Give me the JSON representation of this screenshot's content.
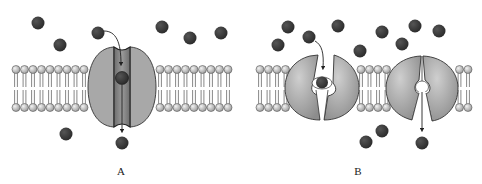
{
  "diagram": {
    "panels": [
      {
        "id": "A",
        "label": "A",
        "type": "channel-protein",
        "description": "Solute passes through an open aqueous channel across the lipid bilayer"
      },
      {
        "id": "B",
        "label": "B",
        "type": "carrier-protein",
        "description": "Solute binds carrier, carrier changes conformation, solute released on the other side"
      }
    ],
    "colors": {
      "molecule": "#3a3a3a",
      "protein": "#a9a9a9",
      "protein_dark": "#7a7a7a",
      "lipid_head": "#bdbdbd",
      "outline": "#333333",
      "background": "#ffffff"
    }
  }
}
